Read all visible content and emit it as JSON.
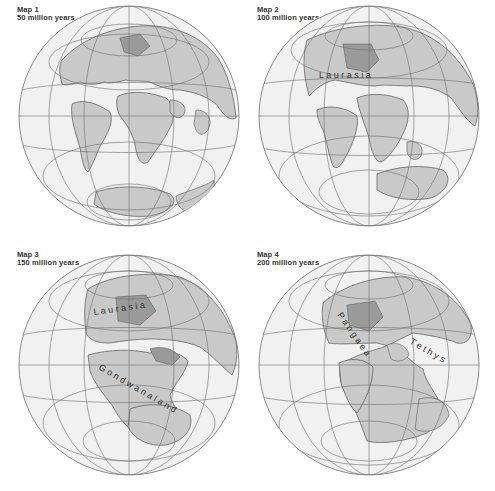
{
  "colors": {
    "background": "#ffffff",
    "ocean": "#f1f1f1",
    "land": "#c9c9c9",
    "land_dark": "#9a9a9a",
    "graticule": "#6f6f6f",
    "coast": "#555555",
    "text": "#333333"
  },
  "maps": [
    {
      "id": "map-1",
      "title": "Map 1",
      "age": "50 million years",
      "labels": []
    },
    {
      "id": "map-2",
      "title": "Map 2",
      "age": "100 million years",
      "labels": [
        {
          "text": "L a u r a s i a",
          "name": "laurasia-label"
        }
      ]
    },
    {
      "id": "map-3",
      "title": "Map 3",
      "age": "150 million years",
      "labels": [
        {
          "text": "L a u r a s i a",
          "name": "laurasia-label"
        },
        {
          "text": "G o n d w a n a l a n d",
          "name": "gondwanaland-label"
        }
      ]
    },
    {
      "id": "map-4",
      "title": "Map 4",
      "age": "200 million years",
      "labels": [
        {
          "text": "P a n g a e a",
          "name": "pangaea-label"
        },
        {
          "text": "T e t h y s",
          "name": "tethys-label"
        }
      ]
    }
  ],
  "label_text": {
    "map2_laurasia": [
      "L",
      "a",
      "u",
      "r",
      "a",
      "s",
      "i",
      "a"
    ],
    "map3_laurasia": [
      "L",
      "a",
      "u",
      "r",
      "a",
      "s",
      "i",
      "a"
    ],
    "map3_gondwanaland": [
      "G",
      "o",
      "n",
      "d",
      "w",
      "a",
      "n",
      "a",
      "l",
      "a",
      "n",
      "d"
    ],
    "map4_pangaea": [
      "P",
      "a",
      "n",
      "g",
      "a",
      "e",
      "a"
    ],
    "map4_tethys": [
      "T",
      "e",
      "t",
      "h",
      "y",
      "s"
    ]
  }
}
